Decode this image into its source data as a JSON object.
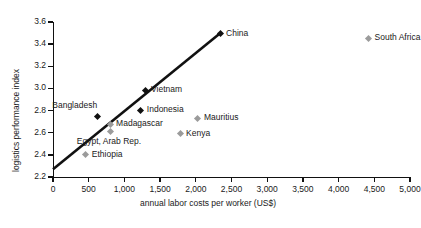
{
  "chart_data": {
    "type": "scatter",
    "title": "",
    "xlabel": "annual labor costs per worker (US$)",
    "ylabel": "logistics performance index",
    "xlim": [
      0,
      5000
    ],
    "ylim": [
      2.2,
      3.6
    ],
    "xticks": [
      "0",
      "500",
      "1,000",
      "1,500",
      "2,000",
      "2,500",
      "3,000",
      "3,500",
      "4,000",
      "4,500",
      "5,000"
    ],
    "xtick_values": [
      0,
      500,
      1000,
      1500,
      2000,
      2500,
      3000,
      3500,
      4000,
      4500,
      5000
    ],
    "yticks": [
      "2.2",
      "2.4",
      "2.6",
      "2.8",
      "3.0",
      "3.2",
      "3.4",
      "3.6"
    ],
    "ytick_values": [
      2.2,
      2.4,
      2.6,
      2.8,
      3.0,
      3.2,
      3.4,
      3.6
    ],
    "grid": false,
    "legend": "none",
    "series": [
      {
        "name": "comparator countries",
        "marker": "diamond",
        "color": "#111111",
        "points": [
          {
            "label": "Bangladesh",
            "x": 620,
            "y": 2.745,
            "label_pos": "above-left"
          },
          {
            "label": "Indonesia",
            "x": 1230,
            "y": 2.805,
            "label_pos": "right"
          },
          {
            "label": "Vietnam",
            "x": 1290,
            "y": 2.985,
            "label_pos": "right"
          },
          {
            "label": "China",
            "x": 2340,
            "y": 3.495,
            "label_pos": "right"
          }
        ]
      },
      {
        "name": "African comparators",
        "marker": "diamond",
        "color": "#9b9b9b",
        "points": [
          {
            "label": "Ethiopia",
            "x": 460,
            "y": 2.4,
            "label_pos": "right"
          },
          {
            "label": "Madagascar",
            "x": 800,
            "y": 2.675,
            "label_pos": "right"
          },
          {
            "label": "Egypt, Arab Rep.",
            "x": 810,
            "y": 2.615,
            "label_pos": "below-right"
          },
          {
            "label": "Kenya",
            "x": 1780,
            "y": 2.59,
            "label_pos": "right"
          },
          {
            "label": "Mauritius",
            "x": 2030,
            "y": 2.73,
            "label_pos": "right"
          },
          {
            "label": "South Africa",
            "x": 4420,
            "y": 3.455,
            "label_pos": "right"
          }
        ]
      }
    ],
    "trendline": {
      "type": "linear",
      "x_start": 0,
      "y_start": 2.27,
      "x_end": 2345,
      "y_end": 3.5,
      "color": "#111111"
    }
  }
}
